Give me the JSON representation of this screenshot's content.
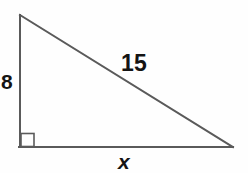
{
  "figure": {
    "kind": "right-triangle-diagram",
    "background_color": "#fefefe",
    "stroke_color": "#5a5a5a",
    "text_color": "#141414",
    "stroke_width": 2,
    "canvas": {
      "width": 248,
      "height": 173
    },
    "vertices": {
      "apex": {
        "x": 20,
        "y": 15
      },
      "right_angle": {
        "x": 20,
        "y": 147
      },
      "base_right": {
        "x": 233,
        "y": 147
      }
    },
    "right_angle_marker": {
      "name": "right-angle-square",
      "x": 20,
      "y": 133,
      "size": 14
    },
    "labels": {
      "vertical_leg": "8",
      "hypotenuse": "15",
      "horizontal_leg": "x"
    }
  }
}
